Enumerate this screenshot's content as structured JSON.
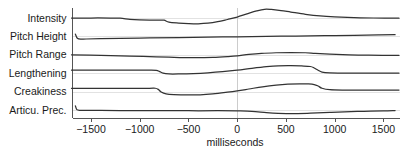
{
  "chart_data": {
    "type": "line",
    "title": "",
    "xlabel": "milliseconds",
    "ylabel": "",
    "xlim": [
      -1700,
      1660
    ],
    "xticks": [
      -1500,
      -1000,
      -500,
      0,
      500,
      1000,
      1500
    ],
    "xticklabels": [
      "−1500",
      "−1000",
      "−500",
      "0",
      "500",
      "1000",
      "1500"
    ],
    "grid": "zero-line-only",
    "legend": "none",
    "annotations": [
      "vertical reference line at 0 milliseconds"
    ],
    "row_order": [
      "Intensity",
      "Pitch Height",
      "Pitch Range",
      "Lengthening",
      "Creakiness",
      "Articu. Prec."
    ],
    "series": [
      {
        "name": "Intensity",
        "row_index": 0,
        "x": [
          -1700,
          -1500,
          -1300,
          -1200,
          -1100,
          -1000,
          -900,
          -800,
          -750,
          -700,
          -600,
          -500,
          -400,
          -300,
          -200,
          -100,
          0,
          100,
          200,
          280,
          350,
          450,
          550,
          700,
          850,
          1000,
          1200,
          1400,
          1660
        ],
        "values": [
          0.5,
          0.5,
          0.5,
          0.49,
          0.43,
          0.4,
          0.39,
          0.39,
          0.38,
          0.28,
          0.23,
          0.2,
          0.19,
          0.22,
          0.3,
          0.42,
          0.55,
          0.72,
          0.88,
          0.97,
          0.96,
          0.9,
          0.82,
          0.7,
          0.61,
          0.56,
          0.52,
          0.5,
          0.49
        ]
      },
      {
        "name": "Pitch Height",
        "row_index": 1,
        "x": [
          -1660,
          -1640,
          -1600,
          -1550,
          -1400,
          -1200,
          -900,
          -600,
          -300,
          0,
          300,
          600,
          900,
          1200,
          1450,
          1620
        ],
        "values": [
          0.62,
          0.4,
          0.35,
          0.36,
          0.38,
          0.4,
          0.42,
          0.44,
          0.46,
          0.48,
          0.5,
          0.52,
          0.54,
          0.56,
          0.58,
          0.59
        ]
      },
      {
        "name": "Pitch Range",
        "row_index": 2,
        "x": [
          -1700,
          -1400,
          -1100,
          -900,
          -700,
          -550,
          -400,
          -250,
          -100,
          0,
          120,
          250,
          400,
          550,
          700,
          800,
          950,
          1150,
          1350,
          1660
        ],
        "values": [
          0.5,
          0.47,
          0.43,
          0.4,
          0.37,
          0.35,
          0.35,
          0.36,
          0.4,
          0.44,
          0.52,
          0.58,
          0.61,
          0.62,
          0.61,
          0.58,
          0.54,
          0.5,
          0.48,
          0.47
        ]
      },
      {
        "name": "Lengthening",
        "row_index": 3,
        "x": [
          -1700,
          -1400,
          -1100,
          -900,
          -830,
          -800,
          -760,
          -700,
          -600,
          -450,
          -300,
          -150,
          0,
          150,
          300,
          420,
          550,
          660,
          750,
          790,
          830,
          870,
          950,
          1100,
          1350,
          1660
        ],
        "values": [
          0.66,
          0.66,
          0.66,
          0.66,
          0.65,
          0.6,
          0.5,
          0.46,
          0.46,
          0.48,
          0.52,
          0.58,
          0.66,
          0.76,
          0.85,
          0.9,
          0.91,
          0.89,
          0.86,
          0.78,
          0.66,
          0.56,
          0.52,
          0.51,
          0.51,
          0.51
        ]
      },
      {
        "name": "Creakiness",
        "row_index": 4,
        "x": [
          -1700,
          -1400,
          -1100,
          -900,
          -840,
          -810,
          -780,
          -730,
          -650,
          -500,
          -380,
          -250,
          -100,
          0,
          120,
          260,
          400,
          520,
          640,
          730,
          790,
          830,
          870,
          950,
          1100,
          1350,
          1660
        ],
        "values": [
          0.68,
          0.68,
          0.68,
          0.68,
          0.68,
          0.62,
          0.48,
          0.38,
          0.34,
          0.32,
          0.33,
          0.38,
          0.47,
          0.54,
          0.64,
          0.76,
          0.85,
          0.9,
          0.92,
          0.91,
          0.88,
          0.8,
          0.68,
          0.6,
          0.58,
          0.58,
          0.58
        ]
      },
      {
        "name": "Articu. Prec.",
        "row_index": 5,
        "x": [
          -1660,
          -1645,
          -1610,
          -1550,
          -1400,
          -1100,
          -800,
          -500,
          -200,
          0,
          150,
          300,
          420,
          520,
          620,
          720,
          820,
          950,
          1100,
          1300,
          1500,
          1620
        ],
        "values": [
          0.72,
          0.52,
          0.48,
          0.48,
          0.48,
          0.47,
          0.47,
          0.46,
          0.46,
          0.45,
          0.43,
          0.36,
          0.32,
          0.31,
          0.31,
          0.32,
          0.34,
          0.37,
          0.4,
          0.43,
          0.45,
          0.47
        ]
      }
    ]
  },
  "layout": {
    "plot_left": 71.5,
    "plot_right": 399,
    "plot_top": 8,
    "plot_bottom": 118,
    "row_height": 18.4,
    "row_amplitude": 12,
    "axis_color": "#555555",
    "curve_color": "#333333",
    "gridline_color": "#e2e2e2",
    "zero_line_color": "#cccccc",
    "background": "#ffffff"
  }
}
